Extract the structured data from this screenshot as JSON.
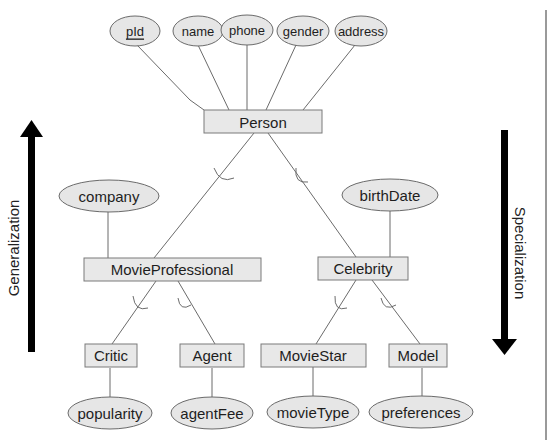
{
  "diagram": {
    "type": "er-generalization-specialization",
    "root_entity": {
      "name": "Person",
      "attributes": [
        "pId",
        "name",
        "phone",
        "gender",
        "address"
      ],
      "key_attribute": "pId"
    },
    "entities": {
      "person": "Person",
      "movie_professional": "MovieProfessional",
      "celebrity": "Celebrity",
      "critic": "Critic",
      "agent": "Agent",
      "movie_star": "MovieStar",
      "model": "Model"
    },
    "attributes": {
      "pid": "pId",
      "name": "name",
      "phone": "phone",
      "gender": "gender",
      "address": "address",
      "company": "company",
      "birth_date": "birthDate",
      "popularity": "popularity",
      "agent_fee": "agentFee",
      "movie_type": "movieType",
      "preferences": "preferences"
    },
    "hierarchy": [
      {
        "parent": "Person",
        "children": [
          "MovieProfessional",
          "Celebrity"
        ]
      },
      {
        "parent": "MovieProfessional",
        "children": [
          "Critic",
          "Agent"
        ]
      },
      {
        "parent": "Celebrity",
        "children": [
          "MovieStar",
          "Model"
        ]
      }
    ],
    "entity_attributes": [
      {
        "entity": "MovieProfessional",
        "attribute": "company"
      },
      {
        "entity": "Celebrity",
        "attribute": "birthDate"
      },
      {
        "entity": "Critic",
        "attribute": "popularity"
      },
      {
        "entity": "Agent",
        "attribute": "agentFee"
      },
      {
        "entity": "MovieStar",
        "attribute": "movieType"
      },
      {
        "entity": "Model",
        "attribute": "preferences"
      }
    ],
    "arrows": {
      "left": {
        "label": "Generalization",
        "direction": "up"
      },
      "right": {
        "label": "Specialization",
        "direction": "down"
      }
    },
    "colors": {
      "shape_fill": "#e6e6e6",
      "shape_stroke": "#6a6a6a",
      "text": "#1e1e1e",
      "arrow": "#000000",
      "border_line": "#9a9a9a"
    }
  }
}
